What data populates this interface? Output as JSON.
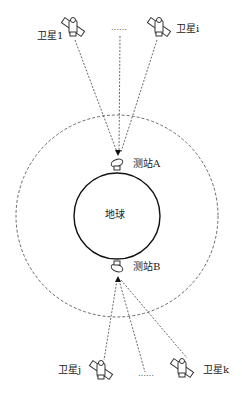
{
  "diagram": {
    "earth_label": "地球",
    "stations": [
      {
        "id": "A",
        "label": "测站A"
      },
      {
        "id": "B",
        "label": "测站B"
      }
    ],
    "satellites": [
      {
        "id": "1",
        "label": "卫星1"
      },
      {
        "id": "i",
        "label": "卫星i"
      },
      {
        "id": "j",
        "label": "卫星j"
      },
      {
        "id": "k",
        "label": "卫星k"
      }
    ],
    "ellipsis_top": "……",
    "ellipsis_bottom": "……"
  }
}
